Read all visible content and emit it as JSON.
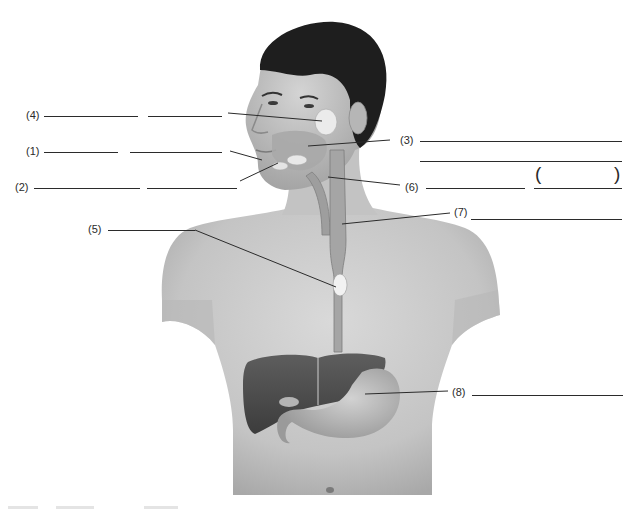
{
  "diagram": {
    "colors": {
      "background": "#ffffff",
      "skin_light": "#d6d6d6",
      "skin_mid": "#bdbdbd",
      "skin_shadow": "#9c9c9c",
      "hair": "#1c1c1c",
      "liver": "#4e4e4e",
      "stomach": "#bababa",
      "gland": "#ececec",
      "line": "#2b2b2b"
    },
    "labels": [
      {
        "id": "4",
        "text": "(4)",
        "blanks": 2,
        "target": "parotid gland"
      },
      {
        "id": "1",
        "text": "(1)",
        "blanks": 2,
        "target": "mouth"
      },
      {
        "id": "2",
        "text": "(2)",
        "blanks": 2,
        "target": "salivary gland (lower jaw)"
      },
      {
        "id": "3",
        "text": "(3)",
        "blanks": 2,
        "target": "pharynx"
      },
      {
        "id": "6",
        "text": "(6)",
        "blanks": 2,
        "target": "throat / larynx region",
        "has_parentheses_blank": true
      },
      {
        "id": "7",
        "text": "(7)",
        "blanks": 1,
        "target": "esophagus"
      },
      {
        "id": "5",
        "text": "(5)",
        "blanks": 1,
        "target": "food bolus in esophagus"
      },
      {
        "id": "8",
        "text": "(8)",
        "blanks": 1,
        "target": "stomach"
      }
    ],
    "paren_open": "(",
    "paren_close": ")"
  }
}
